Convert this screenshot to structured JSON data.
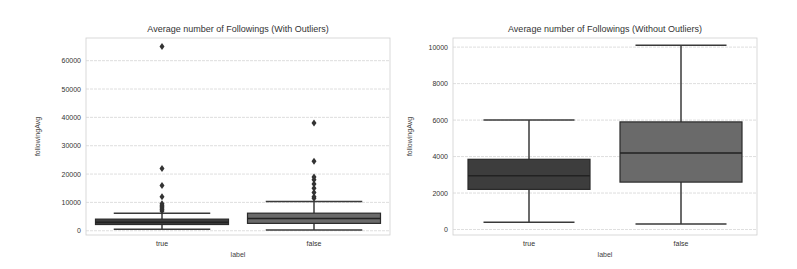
{
  "chart_data": [
    {
      "type": "box",
      "title": "Average number of Followings (With Outliers)",
      "xlabel": "label",
      "ylabel": "followingAvg",
      "categories": [
        "true",
        "false"
      ],
      "ylim": [
        -1500,
        68000
      ],
      "yticks": [
        0,
        10000,
        20000,
        30000,
        40000,
        50000,
        60000
      ],
      "ytick_labels": [
        "0",
        "10000",
        "20000",
        "30000",
        "40000",
        "50000",
        "60000"
      ],
      "grid": true,
      "series": [
        {
          "name": "true",
          "whisker_low": 500,
          "q1": 2200,
          "median": 3000,
          "q3": 4100,
          "whisker_high": 6200,
          "outliers": [
            7000,
            7500,
            8000,
            8500,
            9000,
            9500,
            12000,
            16000,
            22000,
            65000
          ],
          "color": "#3d3d3d"
        },
        {
          "name": "false",
          "whisker_low": 300,
          "q1": 2600,
          "median": 4300,
          "q3": 6200,
          "whisker_high": 10300,
          "outliers": [
            11500,
            12000,
            13500,
            15000,
            16500,
            18000,
            19000,
            24500,
            38000
          ],
          "color": "#6a6a6a"
        }
      ]
    },
    {
      "type": "box",
      "title": "Average number of Followings (Without Outliers)",
      "xlabel": "label",
      "ylabel": "followingAvg",
      "categories": [
        "true",
        "false"
      ],
      "ylim": [
        -300,
        10500
      ],
      "yticks": [
        0,
        2000,
        4000,
        6000,
        8000,
        10000
      ],
      "ytick_labels": [
        "0",
        "2000",
        "4000",
        "6000",
        "8000",
        "10000"
      ],
      "grid": true,
      "series": [
        {
          "name": "true",
          "whisker_low": 400,
          "q1": 2200,
          "median": 2950,
          "q3": 3850,
          "whisker_high": 6000,
          "outliers": [],
          "color": "#3d3d3d"
        },
        {
          "name": "false",
          "whisker_low": 300,
          "q1": 2600,
          "median": 4200,
          "q3": 5900,
          "whisker_high": 10100,
          "outliers": [],
          "color": "#6a6a6a"
        }
      ]
    }
  ]
}
